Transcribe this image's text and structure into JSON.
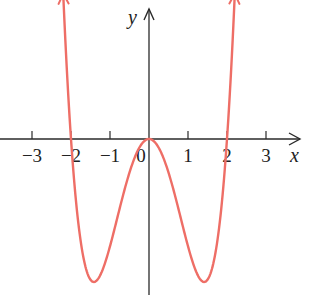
{
  "chart_data": {
    "type": "line",
    "title": "",
    "function": "y = x^4 - 4x^2",
    "xlabel": "x",
    "ylabel": "y",
    "xlim": [
      -3.8,
      3.8
    ],
    "ylim": [
      -4.4,
      3.6
    ],
    "grid": false,
    "legend": null,
    "x_ticks": [
      -3,
      -2,
      -1,
      0,
      1,
      2,
      3
    ],
    "x_tick_labels": [
      "−3",
      "−2",
      "−1",
      "0",
      "1",
      "2",
      "3"
    ],
    "series": [
      {
        "name": "curve",
        "color": "#ee6e66",
        "x": [
          -2.2,
          -2.0,
          -1.75,
          -1.5,
          -1.414,
          -1.25,
          -1.0,
          -0.75,
          -0.5,
          -0.25,
          0.0,
          0.25,
          0.5,
          0.75,
          1.0,
          1.25,
          1.414,
          1.5,
          1.75,
          2.0,
          2.2
        ],
        "y": [
          4.07,
          0.0,
          -2.87,
          -3.94,
          -4.0,
          -3.81,
          -3.0,
          -1.93,
          -0.94,
          -0.25,
          0.0,
          -0.25,
          -0.94,
          -1.93,
          -3.0,
          -3.81,
          -4.0,
          -3.94,
          -2.87,
          0.0,
          4.07
        ]
      }
    ],
    "annotations": {
      "x_intercepts": [
        -2,
        0,
        2
      ],
      "local_max": [
        0,
        0
      ],
      "local_min": [
        [
          -1.414,
          -4
        ],
        [
          1.414,
          -4
        ]
      ],
      "arrows_at_ends": true
    }
  },
  "colors": {
    "axis": "#2a2a2a",
    "curve": "#ee6e66"
  }
}
